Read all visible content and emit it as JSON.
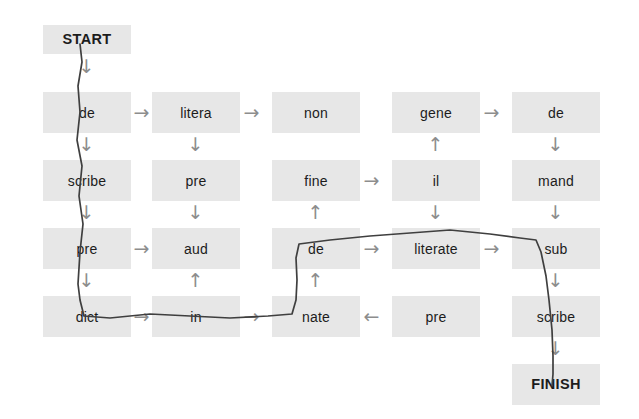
{
  "diagram": {
    "type": "word-maze-grid",
    "start_label": "START",
    "finish_label": "FINISH",
    "grid": {
      "columns": 5,
      "rows": 5,
      "cell_width": 88,
      "cell_height": 41,
      "col_x": [
        43,
        152,
        272,
        392,
        512
      ],
      "row_y": [
        92,
        160,
        228,
        296,
        364
      ]
    },
    "start_cell": {
      "label": "START",
      "x": 43,
      "y": 25,
      "w": 88,
      "h": 29
    },
    "finish_cell": {
      "label": "FINISH",
      "x": 512,
      "y": 364,
      "w": 88,
      "h": 41
    },
    "cells": [
      {
        "label": "de",
        "col": 0,
        "row": 0,
        "x": 43,
        "y": 92
      },
      {
        "label": "litera",
        "col": 1,
        "row": 0,
        "x": 152,
        "y": 92
      },
      {
        "label": "non",
        "col": 2,
        "row": 0,
        "x": 272,
        "y": 92
      },
      {
        "label": "gene",
        "col": 3,
        "row": 0,
        "x": 392,
        "y": 92
      },
      {
        "label": "de",
        "col": 4,
        "row": 0,
        "x": 512,
        "y": 92
      },
      {
        "label": "scribe",
        "col": 0,
        "row": 1,
        "x": 43,
        "y": 160
      },
      {
        "label": "pre",
        "col": 1,
        "row": 1,
        "x": 152,
        "y": 160
      },
      {
        "label": "fine",
        "col": 2,
        "row": 1,
        "x": 272,
        "y": 160
      },
      {
        "label": "il",
        "col": 3,
        "row": 1,
        "x": 392,
        "y": 160
      },
      {
        "label": "mand",
        "col": 4,
        "row": 1,
        "x": 512,
        "y": 160
      },
      {
        "label": "pre",
        "col": 0,
        "row": 2,
        "x": 43,
        "y": 228
      },
      {
        "label": "aud",
        "col": 1,
        "row": 2,
        "x": 152,
        "y": 228
      },
      {
        "label": "de",
        "col": 2,
        "row": 2,
        "x": 272,
        "y": 228
      },
      {
        "label": "literate",
        "col": 3,
        "row": 2,
        "x": 392,
        "y": 228
      },
      {
        "label": "sub",
        "col": 4,
        "row": 2,
        "x": 512,
        "y": 228
      },
      {
        "label": "dict",
        "col": 0,
        "row": 3,
        "x": 43,
        "y": 296
      },
      {
        "label": "in",
        "col": 1,
        "row": 3,
        "x": 152,
        "y": 296
      },
      {
        "label": "nate",
        "col": 2,
        "row": 3,
        "x": 272,
        "y": 296
      },
      {
        "label": "pre",
        "col": 3,
        "row": 3,
        "x": 392,
        "y": 296
      },
      {
        "label": "scribe",
        "col": 4,
        "row": 3,
        "x": 512,
        "y": 296
      }
    ],
    "arrows": [
      {
        "glyph": "→",
        "direction": "right",
        "from": "de(0,0)",
        "to": "litera(1,0)",
        "x": 131,
        "y": 102
      },
      {
        "glyph": "→",
        "direction": "right",
        "from": "litera(1,0)",
        "to": "non(2,0)",
        "x": 241,
        "y": 102
      },
      {
        "glyph": "→",
        "direction": "right",
        "from": "gene(3,0)",
        "to": "de(4,0)",
        "x": 481,
        "y": 102
      },
      {
        "glyph": "→",
        "direction": "right",
        "from": "fine(2,1)",
        "to": "il(3,1)",
        "x": 361,
        "y": 170
      },
      {
        "glyph": "→",
        "direction": "right",
        "from": "pre(0,2)",
        "to": "aud(1,2)",
        "x": 131,
        "y": 238
      },
      {
        "glyph": "→",
        "direction": "right",
        "from": "de(2,2)",
        "to": "literate(3,2)",
        "x": 361,
        "y": 238
      },
      {
        "glyph": "→",
        "direction": "right",
        "from": "literate(3,2)",
        "to": "sub(4,2)",
        "x": 481,
        "y": 238
      },
      {
        "glyph": "→",
        "direction": "right",
        "from": "dict(0,3)",
        "to": "in(1,3)",
        "x": 131,
        "y": 306
      },
      {
        "glyph": "→",
        "direction": "right",
        "from": "in(1,3)",
        "to": "nate(2,3)",
        "x": 241,
        "y": 306
      },
      {
        "glyph": "←",
        "direction": "left",
        "from": "pre(3,3)",
        "to": "nate(2,3)",
        "x": 361,
        "y": 306
      },
      {
        "glyph": "↓",
        "direction": "down",
        "from": "START",
        "to": "de(0,0)",
        "x": 76,
        "y": 56
      },
      {
        "glyph": "↓",
        "direction": "down",
        "from": "de(0,0)",
        "to": "scribe(0,1)",
        "x": 76,
        "y": 134
      },
      {
        "glyph": "↓",
        "direction": "down",
        "from": "scribe(0,1)",
        "to": "pre(0,2)",
        "x": 76,
        "y": 202
      },
      {
        "glyph": "↓",
        "direction": "down",
        "from": "pre(0,2)",
        "to": "dict(0,3)",
        "x": 76,
        "y": 270
      },
      {
        "glyph": "↓",
        "direction": "down",
        "from": "litera(1,0)",
        "to": "pre(1,1)",
        "x": 185,
        "y": 134
      },
      {
        "glyph": "↓",
        "direction": "down",
        "from": "pre(1,1)",
        "to": "aud(1,2)",
        "x": 185,
        "y": 202
      },
      {
        "glyph": "↑",
        "direction": "up",
        "from": "in(1,3)",
        "to": "aud(1,2)",
        "x": 185,
        "y": 270
      },
      {
        "glyph": "↑",
        "direction": "up",
        "from": "de(2,2)",
        "to": "fine(2,1)",
        "x": 305,
        "y": 202
      },
      {
        "glyph": "↑",
        "direction": "up",
        "from": "nate(2,3)",
        "to": "de(2,2)",
        "x": 305,
        "y": 270
      },
      {
        "glyph": "↑",
        "direction": "up",
        "from": "il(3,1)",
        "to": "gene(3,0)",
        "x": 425,
        "y": 134
      },
      {
        "glyph": "↓",
        "direction": "down",
        "from": "il(3,1)",
        "to": "literate(3,2)",
        "x": 425,
        "y": 202
      },
      {
        "glyph": "↓",
        "direction": "down",
        "from": "de(4,0)",
        "to": "mand(4,1)",
        "x": 545,
        "y": 134
      },
      {
        "glyph": "↓",
        "direction": "down",
        "from": "mand(4,1)",
        "to": "sub(4,2)",
        "x": 545,
        "y": 202
      },
      {
        "glyph": "↓",
        "direction": "down",
        "from": "sub(4,2)",
        "to": "scribe(4,3)",
        "x": 545,
        "y": 270
      },
      {
        "glyph": "↓",
        "direction": "down",
        "from": "scribe(4,3)",
        "to": "FINISH",
        "x": 545,
        "y": 338
      }
    ],
    "traced_path": {
      "color": "#3f3f3f",
      "sequence": [
        "START",
        "de",
        "scribe",
        "pre",
        "dict",
        "in",
        "nate",
        "de",
        "literate",
        "sub",
        "scribe",
        "FINISH"
      ],
      "points": "80,44 82,62 78,86 80,112 77,140 82,166 79,196 83,224 80,252 78,284 80,300 84,316 110,318 150,314 190,316 230,318 268,316 292,314 296,300 297,280 296,258 299,244 330,240 370,236 410,233 450,230 490,234 520,238 536,240 541,252 546,276 549,300 552,330 553,356 553,374 552,386"
    },
    "colors": {
      "cell_fill": "#e7e7e7",
      "text": "#1c1c1c",
      "arrow": "#8d8d8d",
      "trace": "#3f3f3f",
      "background": "#ffffff"
    }
  }
}
